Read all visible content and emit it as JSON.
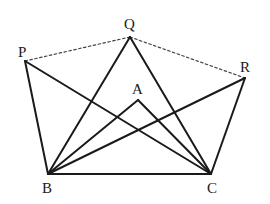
{
  "diagram": {
    "points": {
      "P": {
        "x": 25,
        "y": 61,
        "label": "P",
        "lx": 18,
        "ly": 57
      },
      "Q": {
        "x": 130,
        "y": 37,
        "label": "Q",
        "lx": 124,
        "ly": 29
      },
      "R": {
        "x": 245,
        "y": 78,
        "label": "R",
        "lx": 240,
        "ly": 72
      },
      "A": {
        "x": 138,
        "y": 100,
        "label": "A",
        "lx": 132,
        "ly": 94
      },
      "B": {
        "x": 48,
        "y": 174,
        "label": "B",
        "lx": 42,
        "ly": 193
      },
      "C": {
        "x": 211,
        "y": 174,
        "label": "C",
        "lx": 207,
        "ly": 193
      }
    },
    "solid_segments": [
      [
        "P",
        "B"
      ],
      [
        "P",
        "C"
      ],
      [
        "Q",
        "B"
      ],
      [
        "Q",
        "C"
      ],
      [
        "R",
        "B"
      ],
      [
        "R",
        "C"
      ],
      [
        "A",
        "B"
      ],
      [
        "A",
        "C"
      ],
      [
        "B",
        "C"
      ]
    ],
    "dashed_segments": [
      [
        "P",
        "Q"
      ],
      [
        "Q",
        "R"
      ]
    ],
    "colors": {
      "line": "#1a1a1a",
      "dashed": "#444444"
    }
  }
}
